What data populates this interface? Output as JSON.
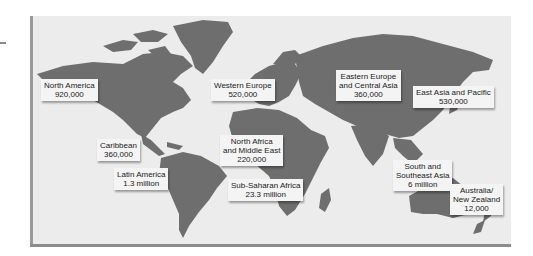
{
  "map": {
    "title": "World map of regional values",
    "regions": [
      {
        "name": "North America",
        "lines": [
          "North America",
          "920,000"
        ],
        "value": "920,000"
      },
      {
        "name": "Western Europe",
        "lines": [
          "Western Europe",
          "520,000"
        ],
        "value": "520,000"
      },
      {
        "name": "Eastern Europe and Central Asia",
        "lines": [
          "Eastern Europe",
          "and Central Asia",
          "360,000"
        ],
        "value": "360,000"
      },
      {
        "name": "East Asia and Pacific",
        "lines": [
          "East Asia and Pacific",
          "530,000"
        ],
        "value": "530,000"
      },
      {
        "name": "Caribbean",
        "lines": [
          "Caribbean",
          "360,000"
        ],
        "value": "360,000"
      },
      {
        "name": "North Africa and Middle East",
        "lines": [
          "North Africa",
          "and Middle East",
          "220,000"
        ],
        "value": "220,000"
      },
      {
        "name": "Latin America",
        "lines": [
          "Latin America",
          "1.3 million"
        ],
        "value": "1.3 million"
      },
      {
        "name": "Sub-Saharan Africa",
        "lines": [
          "Sub-Saharan Africa",
          "23.3 million"
        ],
        "value": "23.3 million"
      },
      {
        "name": "South and Southeast Asia",
        "lines": [
          "South and",
          "Southeast Asia",
          "6 million"
        ],
        "value": "6 million"
      },
      {
        "name": "Australia/New Zealand",
        "lines": [
          "Australia/",
          "New Zealand",
          "12,000"
        ],
        "value": "12,000"
      }
    ],
    "colors": {
      "ocean": "#ececec",
      "land": "#6e6e6e",
      "label_bg": "#f4f4f4"
    }
  }
}
